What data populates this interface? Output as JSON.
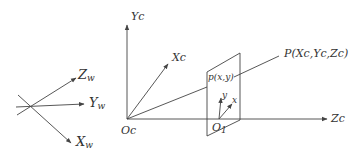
{
  "figure": {
    "type": "pinhole-camera-coordinate-systems",
    "stroke_color": "#444444",
    "background": "#ffffff"
  },
  "world_frame": {
    "axes": [
      {
        "name": "Zw",
        "main": "Z",
        "sub": "w"
      },
      {
        "name": "Yw",
        "main": "Y",
        "sub": "w"
      },
      {
        "name": "Xw",
        "main": "X",
        "sub": "w"
      }
    ]
  },
  "camera_frame": {
    "origin_label": "Oc",
    "axes": [
      {
        "name": "Yc",
        "label": "Yc"
      },
      {
        "name": "Xc",
        "label": "Xc"
      },
      {
        "name": "Zc",
        "label": "Zc"
      }
    ]
  },
  "image_plane": {
    "origin_label_main": "O",
    "origin_label_sub": "1",
    "axes": [
      {
        "name": "x",
        "label": "x"
      },
      {
        "name": "y",
        "label": "y"
      }
    ],
    "projected_point_label": "p(x,y)"
  },
  "world_point": {
    "label": "P(Xc,Yc,Zc)"
  }
}
